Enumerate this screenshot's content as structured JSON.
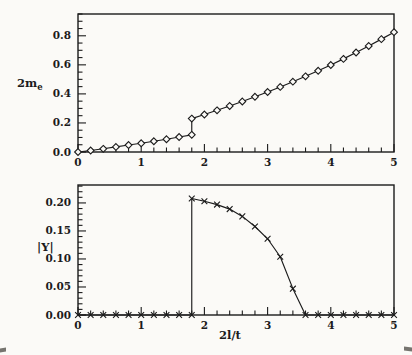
{
  "figure": {
    "background": "#fbfaf7",
    "ink": "#1b1b1b",
    "marker_fill": "#fbfaf7"
  },
  "labels": {
    "top_ylabel_main": "2m",
    "top_ylabel_sub": "e",
    "bottom_ylabel": "|Y|",
    "xlabel": "2l/t"
  },
  "chart_data": [
    {
      "type": "line",
      "panel": "top",
      "title": "",
      "ylabel": "2m_e",
      "xlabel": "",
      "marker": "diamond",
      "grid": false,
      "legend": "none",
      "xlim": [
        0,
        5
      ],
      "ylim": [
        0,
        0.95
      ],
      "x_major_ticks": [
        0,
        1,
        2,
        3,
        4,
        5
      ],
      "x_tick_labels": [
        "0",
        "1",
        "2",
        "3",
        "4",
        "5"
      ],
      "x_minor_step": 0.2,
      "y_major_ticks": [
        0,
        0.2,
        0.4,
        0.6,
        0.8
      ],
      "y_tick_labels": [
        "0.0",
        "0.2",
        "0.4",
        "0.6",
        "0.8"
      ],
      "y_minor_step": 0.05,
      "note": "discontinuous jump at x=1.8",
      "x": [
        0,
        0.2,
        0.4,
        0.6,
        0.8,
        1.0,
        1.2,
        1.4,
        1.6,
        1.8,
        1.8,
        2.0,
        2.2,
        2.4,
        2.6,
        2.8,
        3.0,
        3.2,
        3.4,
        3.6,
        3.8,
        4.0,
        4.2,
        4.4,
        4.6,
        4.8,
        5.0
      ],
      "y": [
        0.0,
        0.01,
        0.022,
        0.035,
        0.048,
        0.06,
        0.074,
        0.088,
        0.103,
        0.118,
        0.23,
        0.258,
        0.287,
        0.317,
        0.348,
        0.38,
        0.413,
        0.448,
        0.484,
        0.521,
        0.559,
        0.599,
        0.641,
        0.685,
        0.73,
        0.777,
        0.825
      ]
    },
    {
      "type": "line",
      "panel": "bottom",
      "title": "",
      "ylabel": "|Y|",
      "xlabel": "2l/t",
      "marker": "x",
      "grid": false,
      "legend": "none",
      "xlim": [
        0,
        5
      ],
      "ylim": [
        0,
        0.232
      ],
      "x_major_ticks": [
        0,
        1,
        2,
        3,
        4,
        5
      ],
      "x_tick_labels": [
        "0",
        "1",
        "2",
        "3",
        "4",
        "5"
      ],
      "x_minor_step": 0.2,
      "y_major_ticks": [
        0,
        0.05,
        0.1,
        0.15,
        0.2
      ],
      "y_tick_labels": [
        "0.00",
        "0.05",
        "0.10",
        "0.15",
        "0.20"
      ],
      "y_minor_step": 0.01,
      "note": "jumps from 0 to 0.208 at x=1.8, vanishes at x=3.6",
      "x": [
        0,
        0.2,
        0.4,
        0.6,
        0.8,
        1.0,
        1.2,
        1.4,
        1.6,
        1.8,
        1.8,
        2.0,
        2.2,
        2.4,
        2.6,
        2.8,
        3.0,
        3.2,
        3.4,
        3.6,
        3.8,
        4.0,
        4.2,
        4.4,
        4.6,
        4.8,
        5.0
      ],
      "y": [
        0,
        0,
        0,
        0,
        0,
        0,
        0,
        0,
        0,
        0,
        0.208,
        0.203,
        0.197,
        0.189,
        0.176,
        0.158,
        0.136,
        0.104,
        0.047,
        0,
        0,
        0,
        0,
        0,
        0,
        0,
        0
      ]
    }
  ]
}
